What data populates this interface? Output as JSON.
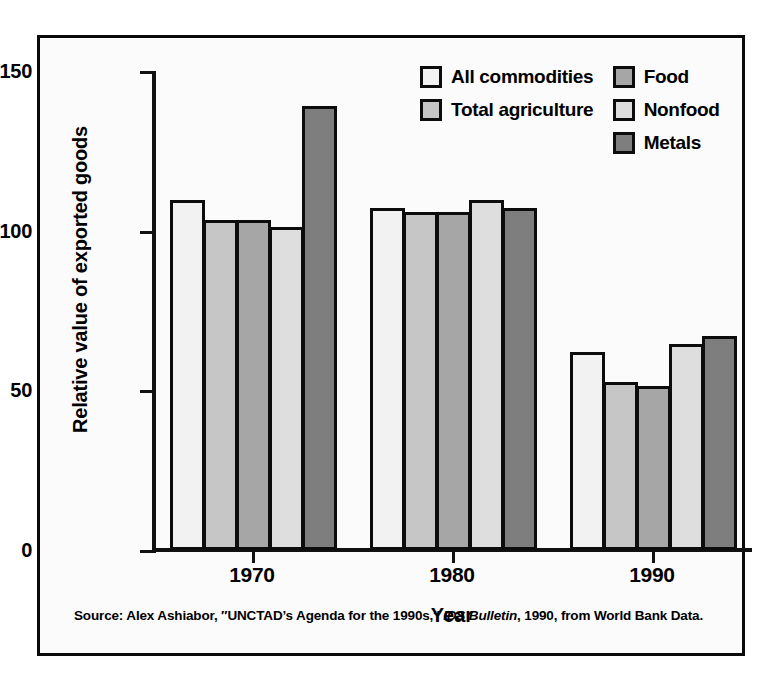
{
  "figure": {
    "source_prefix": "Source: Alex Ashiabor, ″UNCTAD’s Agenda for the 1990s,″ ",
    "source_italic": "IDS Bulletin",
    "source_suffix": ", 1990, from World Bank Data."
  },
  "legend": {
    "left_column": [
      {
        "label": "All commodities",
        "color": "#f2f2f2",
        "swatch_name": "legend-swatch-all-commodities"
      },
      {
        "label": "Total agriculture",
        "color": "#c6c6c6",
        "swatch_name": "legend-swatch-total-agriculture"
      }
    ],
    "right_column": [
      {
        "label": "Food",
        "color": "#a6a6a6",
        "swatch_name": "legend-swatch-food"
      },
      {
        "label": "Nonfood",
        "color": "#dedede",
        "swatch_name": "legend-swatch-nonfood"
      },
      {
        "label": "Metals",
        "color": "#7e7e7e",
        "swatch_name": "legend-swatch-metals"
      }
    ]
  },
  "chart_data": {
    "type": "bar",
    "title": "",
    "xlabel": "Year",
    "ylabel": "Relative value of exported goods",
    "categories": [
      "1970",
      "1980",
      "1990"
    ],
    "ylim": [
      0,
      150
    ],
    "yticks": [
      0,
      50,
      100,
      150
    ],
    "ytick_labels": [
      "0",
      "50",
      "100",
      "150"
    ],
    "grid": false,
    "legend_position": "top-right",
    "series": [
      {
        "name": "All commodities",
        "color": "#f2f2f2",
        "values": [
          109.5,
          107.0,
          62.0
        ]
      },
      {
        "name": "Total agriculture",
        "color": "#c6c6c6",
        "values": [
          103.5,
          106.0,
          52.5
        ]
      },
      {
        "name": "Food",
        "color": "#a6a6a6",
        "values": [
          103.5,
          106.0,
          51.5
        ]
      },
      {
        "name": "Nonfood",
        "color": "#dedede",
        "values": [
          101.0,
          109.5,
          64.5
        ]
      },
      {
        "name": "Metals",
        "color": "#7e7e7e",
        "values": [
          139.0,
          107.0,
          67.0
        ]
      }
    ]
  }
}
